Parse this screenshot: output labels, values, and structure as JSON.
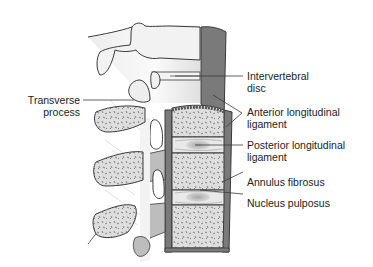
{
  "figure": {
    "labels": {
      "intervertebral_disc": [
        "Intervertebral",
        "disc"
      ],
      "anterior_longitudinal_ligament": [
        "Anterior longitudinal",
        "ligament"
      ],
      "posterior_longitudinal_ligament": [
        "Posterior longitudinal",
        "ligament"
      ],
      "annulus_fibrosus": "Annulus fibrosus",
      "nucleus_pulposus": "Nucleus pulposus",
      "transverse_process": [
        "Transverse",
        "process"
      ]
    },
    "colors": {
      "background": "#ffffff",
      "outline": "#3a3a3a",
      "ligament_dark": "#7a7a7a",
      "bone_fill": "#dcdcdc",
      "cortex": "#9a9a9a",
      "disc_fill": "#e6e6e6",
      "nucleus": "#bcbcbc",
      "text": "#222222"
    }
  }
}
